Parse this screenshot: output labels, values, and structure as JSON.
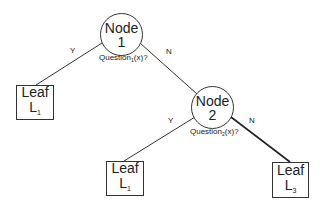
{
  "diagram": {
    "type": "decision-tree",
    "nodes": [
      {
        "id": "node1",
        "title": "Node",
        "number": "1",
        "question_prefix": "Question",
        "question_sub": "1",
        "question_suffix": "(x)?"
      },
      {
        "id": "node2",
        "title": "Node",
        "number": "2",
        "question_prefix": "Question",
        "question_sub": "2",
        "question_suffix": "(x)?"
      }
    ],
    "leaves": [
      {
        "id": "leaf-left",
        "title": "Leaf",
        "label": "L",
        "sub": "1"
      },
      {
        "id": "leaf-mid",
        "title": "Leaf",
        "label": "L",
        "sub": "1"
      },
      {
        "id": "leaf-right",
        "title": "Leaf",
        "label": "L",
        "sub": "3"
      }
    ],
    "edges": [
      {
        "from": "node1",
        "to": "leaf-left",
        "label": "Y"
      },
      {
        "from": "node1",
        "to": "node2",
        "label": "N"
      },
      {
        "from": "node2",
        "to": "leaf-mid",
        "label": "Y"
      },
      {
        "from": "node2",
        "to": "leaf-right",
        "label": "N"
      }
    ]
  }
}
